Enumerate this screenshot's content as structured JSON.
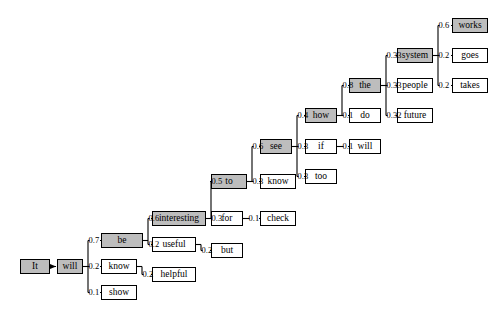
{
  "diagram": {
    "type": "beam-search-lattice",
    "title": "",
    "colors": {
      "shaded_node": "#bdbdbd",
      "plain_node": "#ffffff",
      "edge": "#000000",
      "text": "#000000"
    },
    "nodes": [
      {
        "id": "it",
        "label": "It",
        "shaded": true,
        "x": 20,
        "y": 259,
        "w": 30
      },
      {
        "id": "will1",
        "label": "will",
        "shaded": true,
        "x": 57,
        "y": 259,
        "w": 26
      },
      {
        "id": "be",
        "label": "be",
        "shaded": true,
        "x": 101,
        "y": 233,
        "w": 42
      },
      {
        "id": "know1",
        "label": "know",
        "shaded": false,
        "x": 101,
        "y": 259,
        "w": 36
      },
      {
        "id": "show",
        "label": "show",
        "shaded": false,
        "x": 101,
        "y": 285,
        "w": 36
      },
      {
        "id": "interesting",
        "label": "interesting",
        "shaded": true,
        "x": 152,
        "y": 211,
        "w": 54
      },
      {
        "id": "useful",
        "label": "useful",
        "shaded": false,
        "x": 152,
        "y": 237,
        "w": 44
      },
      {
        "id": "helpful",
        "label": "helpful",
        "shaded": false,
        "x": 152,
        "y": 267,
        "w": 44
      },
      {
        "id": "to",
        "label": "to",
        "shaded": true,
        "x": 211,
        "y": 174,
        "w": 36
      },
      {
        "id": "for",
        "label": "for",
        "shaded": false,
        "x": 211,
        "y": 211,
        "w": 32
      },
      {
        "id": "but",
        "label": "but",
        "shaded": false,
        "x": 211,
        "y": 243,
        "w": 32
      },
      {
        "id": "see",
        "label": "see",
        "shaded": true,
        "x": 260,
        "y": 139,
        "w": 32
      },
      {
        "id": "know2",
        "label": "know",
        "shaded": false,
        "x": 260,
        "y": 174,
        "w": 36
      },
      {
        "id": "check",
        "label": "check",
        "shaded": false,
        "x": 260,
        "y": 211,
        "w": 36
      },
      {
        "id": "how",
        "label": "how",
        "shaded": true,
        "x": 305,
        "y": 108,
        "w": 32
      },
      {
        "id": "if",
        "label": "if",
        "shaded": false,
        "x": 305,
        "y": 139,
        "w": 32
      },
      {
        "id": "too",
        "label": "too",
        "shaded": false,
        "x": 305,
        "y": 169,
        "w": 32
      },
      {
        "id": "the",
        "label": "the",
        "shaded": true,
        "x": 349,
        "y": 78,
        "w": 32
      },
      {
        "id": "do",
        "label": "do",
        "shaded": false,
        "x": 349,
        "y": 108,
        "w": 32
      },
      {
        "id": "will2",
        "label": "will",
        "shaded": false,
        "x": 349,
        "y": 139,
        "w": 32
      },
      {
        "id": "system",
        "label": "system",
        "shaded": true,
        "x": 397,
        "y": 48,
        "w": 36
      },
      {
        "id": "people",
        "label": "people",
        "shaded": false,
        "x": 397,
        "y": 78,
        "w": 36
      },
      {
        "id": "future",
        "label": "future",
        "shaded": false,
        "x": 397,
        "y": 108,
        "w": 36
      },
      {
        "id": "works",
        "label": "works",
        "shaded": true,
        "x": 452,
        "y": 18,
        "w": 36
      },
      {
        "id": "goes",
        "label": "goes",
        "shaded": false,
        "x": 452,
        "y": 48,
        "w": 36
      },
      {
        "id": "takes",
        "label": "takes",
        "shaded": false,
        "x": 452,
        "y": 78,
        "w": 36
      }
    ],
    "edges": [
      {
        "from": "it",
        "to": "will1",
        "weight": ""
      },
      {
        "from": "will1",
        "to": "be",
        "weight": "0.7"
      },
      {
        "from": "will1",
        "to": "know1",
        "weight": "0.2"
      },
      {
        "from": "will1",
        "to": "show",
        "weight": "0.1"
      },
      {
        "from": "be",
        "to": "interesting",
        "weight": "0.6"
      },
      {
        "from": "be",
        "to": "useful",
        "weight": "0.2"
      },
      {
        "from": "know1",
        "to": "helpful",
        "weight": "0.2"
      },
      {
        "from": "interesting",
        "to": "to",
        "weight": "0.5"
      },
      {
        "from": "interesting",
        "to": "for",
        "weight": "0.3"
      },
      {
        "from": "useful",
        "to": "but",
        "weight": "0.2"
      },
      {
        "from": "to",
        "to": "see",
        "weight": "0.6"
      },
      {
        "from": "to",
        "to": "know2",
        "weight": "0.3"
      },
      {
        "from": "for",
        "to": "check",
        "weight": "0.1"
      },
      {
        "from": "see",
        "to": "how",
        "weight": "0.4"
      },
      {
        "from": "see",
        "to": "if",
        "weight": "0.3"
      },
      {
        "from": "see",
        "to": "too",
        "weight": "0.3"
      },
      {
        "from": "how",
        "to": "the",
        "weight": "0.8"
      },
      {
        "from": "how",
        "to": "do",
        "weight": "0.1"
      },
      {
        "from": "if",
        "to": "will2",
        "weight": "0.1"
      },
      {
        "from": "the",
        "to": "system",
        "weight": "0.33"
      },
      {
        "from": "the",
        "to": "people",
        "weight": "0.33"
      },
      {
        "from": "the",
        "to": "future",
        "weight": "0.32"
      },
      {
        "from": "system",
        "to": "works",
        "weight": "0.6"
      },
      {
        "from": "system",
        "to": "goes",
        "weight": "0.2"
      },
      {
        "from": "system",
        "to": "takes",
        "weight": "0.2"
      }
    ]
  }
}
